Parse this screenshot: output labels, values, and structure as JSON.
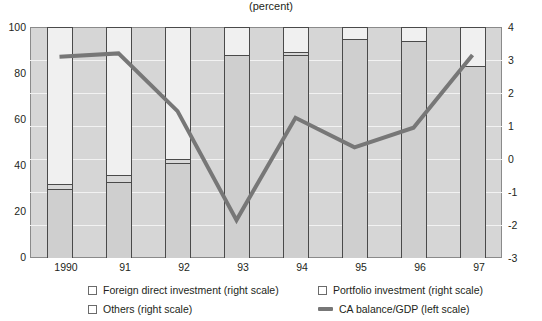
{
  "chart_data": {
    "type": "bar",
    "title": "(percent)",
    "xlabel": "",
    "ylabel": "",
    "categories": [
      "1990",
      "91",
      "92",
      "93",
      "94",
      "95",
      "96",
      "97"
    ],
    "ylim": [
      0,
      100
    ],
    "y2lim": [
      -3,
      4
    ],
    "yticks": [
      "0",
      "20",
      "40",
      "60",
      "80",
      "100"
    ],
    "y2ticks": [
      "-3",
      "-2",
      "-1",
      "0",
      "1",
      "2",
      "3",
      "4"
    ],
    "grid": true,
    "legend_position": "bottom",
    "stacked": true,
    "series": [
      {
        "name": "Foreign direct investment (right scale)",
        "axis": "right-scale-share",
        "values": [
          30,
          33,
          41,
          88,
          88,
          95,
          94,
          83
        ]
      },
      {
        "name": "Portfolio investment (right scale)",
        "axis": "right-scale-share",
        "values": [
          2,
          3,
          2,
          0,
          1,
          0,
          0,
          0
        ]
      },
      {
        "name": "Others (right scale)",
        "axis": "right-scale-share",
        "values": [
          68,
          64,
          57,
          12,
          11,
          5,
          6,
          17
        ]
      }
    ],
    "line_series": {
      "name": "CA balance/GDP (left scale)",
      "axis": "right",
      "color": "#777777",
      "x": [
        "1990",
        "91",
        "92",
        "93",
        "94",
        "95",
        "96",
        "97"
      ],
      "values": [
        3.1,
        3.2,
        1.45,
        -1.85,
        1.25,
        0.35,
        0.95,
        3.15
      ]
    }
  },
  "chart": {
    "title": "(percent)"
  },
  "axes": {
    "left": {
      "ticks": [
        "100",
        "80",
        "60",
        "40",
        "20",
        "0"
      ]
    },
    "right": {
      "ticks": [
        "4",
        "3",
        "2",
        "1",
        "0",
        "-1",
        "-2",
        "-3"
      ]
    },
    "x": {
      "ticks": [
        "1990",
        "91",
        "92",
        "93",
        "94",
        "95",
        "96",
        "97"
      ]
    }
  },
  "legend": {
    "items": [
      {
        "label": "Foreign direct investment (right scale)",
        "marker": "square-icon"
      },
      {
        "label": "Portfolio investment (right scale)",
        "marker": "square-icon"
      },
      {
        "label": "Others (right scale)",
        "marker": "square-icon"
      },
      {
        "label": "CA balance/GDP (left scale)",
        "marker": "line-swatch-icon"
      }
    ]
  },
  "colors": {
    "plot_background": "#d6d6d6",
    "fdi": "#cfcfcf",
    "portfolio": "#d8d8d8",
    "others": "#f0f0f0",
    "line": "#777777",
    "axis": "#8a8a8a",
    "text": "#231f20"
  }
}
